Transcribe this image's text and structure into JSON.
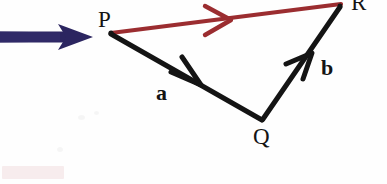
{
  "figure": {
    "background_color": "#fefefe",
    "colors": {
      "vector_black": "#141414",
      "resultant_red": "#9b2d30",
      "pointer_navy": "#2b2560",
      "label_text": "#141414",
      "watermark_pink": "#d6969b"
    },
    "points": [
      {
        "name": "P",
        "label": "P",
        "x": 110,
        "y": 32
      },
      {
        "name": "Q",
        "label": "Q",
        "x": 262,
        "y": 120
      },
      {
        "name": "R",
        "label": "R",
        "x": 340,
        "y": 5
      }
    ],
    "vectors": [
      {
        "name": "a",
        "label": "a",
        "from": "P",
        "to": "Q",
        "color": "#141414",
        "arrowhead_at": {
          "x": 196,
          "y": 82
        },
        "label_position": {
          "x": 156,
          "y": 82
        }
      },
      {
        "name": "b",
        "label": "b",
        "from": "Q",
        "to": "R",
        "color": "#141414",
        "arrowhead_at": {
          "x": 305,
          "y": 60
        },
        "label_position": {
          "x": 321,
          "y": 57
        }
      },
      {
        "name": "resultant",
        "label": "",
        "from": "P",
        "to": "R",
        "color": "#9b2d30",
        "arrowhead_at": {
          "x": 226,
          "y": 20
        },
        "label_position": null
      }
    ],
    "pointer": {
      "name": "navy-pointer-arrow",
      "color": "#2b2560",
      "from": {
        "x": -4,
        "y": 37
      },
      "to": {
        "x": 92,
        "y": 37
      },
      "points_to": "P"
    },
    "annotations": {
      "watermark": "faint pink smudge at bottom-left",
      "note": "R label is clipped at the top edge of the image"
    }
  }
}
